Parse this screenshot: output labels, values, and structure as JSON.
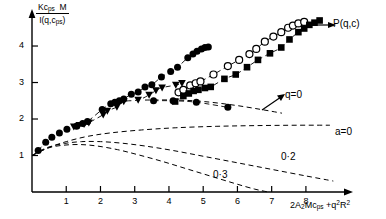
{
  "chart_data": {
    "type": "scatter",
    "title": "",
    "xlabel": "2A2Mcps + q2R2",
    "ylabel": "Kcps M / I(q,cps)",
    "xlim": [
      0,
      9.2
    ],
    "ylim": [
      0,
      4.85
    ],
    "xticks": [
      1,
      2,
      3,
      4,
      5,
      6,
      7,
      8
    ],
    "yticks": [
      1,
      2,
      3,
      4
    ],
    "grid": false,
    "legend": "none",
    "annotations": [
      {
        "text": "P(q,c)",
        "x": 8.85,
        "y": 4.45,
        "arrow": true
      },
      {
        "text": "q=0",
        "x": 6.95,
        "y": 2.62,
        "arrow": true
      },
      {
        "text": "a=0",
        "x": 8.2,
        "y": 1.55,
        "arrow": false
      },
      {
        "text": "0·2",
        "x": 6.8,
        "y": 0.85,
        "arrow": false
      },
      {
        "text": "0·3",
        "x": 5.55,
        "y": 0.45,
        "arrow": false
      }
    ],
    "series": [
      {
        "name": "filled-circle-upper",
        "marker": "filled-circle",
        "points": [
          [
            0.18,
            1.14
          ],
          [
            0.4,
            1.36
          ],
          [
            0.58,
            1.5
          ],
          [
            0.8,
            1.62
          ],
          [
            1.02,
            1.72
          ],
          [
            1.3,
            1.8
          ],
          [
            1.48,
            1.88
          ],
          [
            1.62,
            1.93
          ],
          [
            2.05,
            2.26
          ],
          [
            2.3,
            2.42
          ],
          [
            2.42,
            2.46
          ],
          [
            2.55,
            2.5
          ],
          [
            2.68,
            2.55
          ],
          [
            2.9,
            2.68
          ],
          [
            3.1,
            2.74
          ],
          [
            3.3,
            2.88
          ],
          [
            3.5,
            2.94
          ],
          [
            3.78,
            3.15
          ],
          [
            4.05,
            3.3
          ],
          [
            4.25,
            3.42
          ],
          [
            4.55,
            3.68
          ],
          [
            4.7,
            3.78
          ],
          [
            4.82,
            3.86
          ],
          [
            4.95,
            3.92
          ],
          [
            5.05,
            3.96
          ],
          [
            5.15,
            3.97
          ]
        ]
      },
      {
        "name": "filled-triangle",
        "marker": "filled-triangle",
        "points": [
          [
            1.22,
            1.79
          ],
          [
            1.38,
            1.83
          ],
          [
            1.52,
            1.86
          ],
          [
            1.66,
            1.9
          ],
          [
            2.08,
            2.12
          ],
          [
            2.2,
            2.22
          ],
          [
            2.48,
            2.33
          ],
          [
            2.68,
            2.48
          ],
          [
            3.1,
            2.52
          ],
          [
            3.42,
            2.66
          ],
          [
            3.62,
            2.78
          ],
          [
            3.8,
            2.86
          ],
          [
            4.2,
            2.93
          ],
          [
            4.38,
            2.98
          ]
        ]
      },
      {
        "name": "open-circle",
        "marker": "open-circle",
        "points": [
          [
            4.28,
            2.73
          ],
          [
            4.42,
            2.8
          ],
          [
            4.62,
            2.92
          ],
          [
            4.78,
            2.98
          ],
          [
            4.92,
            3.03
          ],
          [
            5.3,
            3.22
          ],
          [
            5.72,
            3.45
          ],
          [
            6.05,
            3.62
          ],
          [
            6.35,
            3.78
          ],
          [
            6.55,
            3.92
          ],
          [
            6.8,
            4.12
          ],
          [
            7.05,
            4.26
          ],
          [
            7.28,
            4.38
          ],
          [
            7.48,
            4.5
          ],
          [
            7.62,
            4.56
          ],
          [
            7.78,
            4.62
          ],
          [
            7.95,
            4.66
          ]
        ]
      },
      {
        "name": "filled-square",
        "marker": "filled-square",
        "points": [
          [
            4.18,
            2.48
          ],
          [
            4.42,
            2.63
          ],
          [
            4.58,
            2.7
          ],
          [
            4.72,
            2.77
          ],
          [
            4.86,
            2.8
          ],
          [
            5.05,
            2.85
          ],
          [
            5.22,
            2.88
          ],
          [
            5.62,
            3.1
          ],
          [
            5.95,
            3.22
          ],
          [
            6.28,
            3.42
          ],
          [
            6.6,
            3.62
          ],
          [
            6.95,
            3.8
          ],
          [
            7.28,
            3.96
          ],
          [
            7.52,
            4.18
          ],
          [
            7.78,
            4.38
          ],
          [
            7.95,
            4.48
          ],
          [
            8.1,
            4.58
          ],
          [
            8.25,
            4.64
          ],
          [
            8.4,
            4.7
          ]
        ]
      },
      {
        "name": "filled-circle-qzero-branch",
        "marker": "filled-circle",
        "points": [
          [
            3.55,
            2.5
          ],
          [
            4.12,
            2.5
          ],
          [
            4.8,
            2.46
          ],
          [
            5.72,
            2.32
          ]
        ]
      }
    ],
    "dashed_curves": [
      {
        "name": "a=0",
        "points": [
          [
            0.0,
            1.0
          ],
          [
            0.5,
            1.22
          ],
          [
            1.0,
            1.38
          ],
          [
            1.6,
            1.52
          ],
          [
            2.3,
            1.62
          ],
          [
            3.2,
            1.7
          ],
          [
            4.2,
            1.76
          ],
          [
            5.4,
            1.8
          ],
          [
            6.6,
            1.82
          ],
          [
            7.8,
            1.83
          ],
          [
            8.7,
            1.83
          ]
        ]
      },
      {
        "name": "0.2",
        "points": [
          [
            0.0,
            1.0
          ],
          [
            0.45,
            1.22
          ],
          [
            0.95,
            1.33
          ],
          [
            1.45,
            1.38
          ],
          [
            2.0,
            1.38
          ],
          [
            2.6,
            1.34
          ],
          [
            3.3,
            1.26
          ],
          [
            4.1,
            1.14
          ],
          [
            5.0,
            0.98
          ],
          [
            6.0,
            0.8
          ],
          [
            7.0,
            0.62
          ],
          [
            8.0,
            0.44
          ],
          [
            8.8,
            0.3
          ]
        ]
      },
      {
        "name": "0.3",
        "points": [
          [
            0.0,
            1.0
          ],
          [
            0.45,
            1.2
          ],
          [
            0.9,
            1.28
          ],
          [
            1.4,
            1.3
          ],
          [
            1.9,
            1.26
          ],
          [
            2.5,
            1.16
          ],
          [
            3.1,
            1.02
          ],
          [
            3.8,
            0.84
          ],
          [
            4.5,
            0.64
          ],
          [
            5.2,
            0.44
          ],
          [
            5.9,
            0.24
          ],
          [
            6.5,
            0.08
          ],
          [
            6.9,
            0.0
          ]
        ]
      },
      {
        "name": "qzero-trend",
        "points": [
          [
            3.3,
            2.52
          ],
          [
            4.2,
            2.52
          ],
          [
            5.0,
            2.48
          ],
          [
            5.9,
            2.38
          ],
          [
            6.7,
            2.26
          ],
          [
            7.3,
            2.16
          ]
        ]
      }
    ]
  },
  "axis": {
    "ylabel_numerator": "Kcps M",
    "ylabel_denominator": "I(q,cps)",
    "xlabel_text": "2A2Mcps +q2R2",
    "xtick_labels": [
      "1",
      "2",
      "3",
      "4",
      "5",
      "6",
      "7",
      "8"
    ],
    "ytick_labels": [
      "1",
      "2",
      "3",
      "4"
    ]
  },
  "labels": {
    "pqc": "P(q,c)",
    "qzero": "q=0",
    "a0": "a=0",
    "c02": "0·2",
    "c03": "0·3"
  },
  "colors": {
    "ink": "#000000",
    "paper": "#ffffff"
  }
}
